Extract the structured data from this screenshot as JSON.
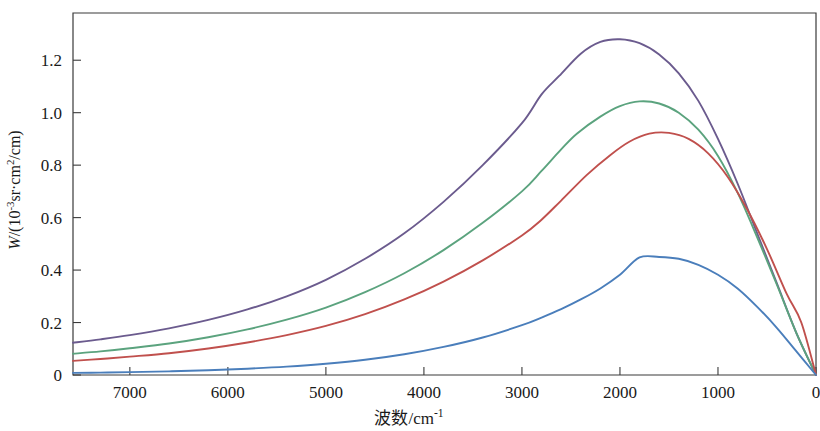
{
  "chart_data": {
    "type": "line",
    "title": "",
    "subtitle": "",
    "xlabel_parts": {
      "cjk": "波数",
      "unit": "/cm",
      "unit_exp": "-1"
    },
    "xlabel": "波数/cm-1",
    "ylabel_parts": {
      "symbol": "W",
      "open": "/(10",
      "exp": "-3",
      "mid": "sr·cm",
      "sq": "2",
      "close": "/cm)"
    },
    "ylabel": "W/(10-3sr·cm2/cm)",
    "xlim": [
      7580,
      0
    ],
    "ylim": [
      0,
      1.38
    ],
    "x_reversed": true,
    "grid": false,
    "legend": "none",
    "xticks": [
      7000,
      6000,
      5000,
      4000,
      3000,
      2000,
      1000,
      0
    ],
    "xtick_labels": [
      "7000",
      "6000",
      "5000",
      "4000",
      "3000",
      "2000",
      "1000",
      "0"
    ],
    "yticks": [
      0,
      0.2,
      0.4,
      0.6,
      0.8,
      1.0,
      1.2
    ],
    "ytick_labels": [
      "0",
      "0.2",
      "0.4",
      "0.6",
      "0.8",
      "1.0",
      "1.2"
    ],
    "axis_color": "#3a3a3a",
    "series": [
      {
        "name": "curve-purple",
        "color": "#6b5b8e",
        "peak_x": 2620,
        "peak_y": 1.28,
        "x": [
          7580,
          7300,
          7000,
          6600,
          6200,
          5800,
          5400,
          5000,
          4600,
          4200,
          3800,
          3400,
          3000,
          2800,
          2620,
          2400,
          2200,
          2000,
          1800,
          1600,
          1400,
          1200,
          1000,
          800,
          600,
          400,
          200,
          0
        ],
        "values": [
          0.123,
          0.136,
          0.152,
          0.178,
          0.21,
          0.25,
          0.3,
          0.363,
          0.443,
          0.54,
          0.66,
          0.8,
          0.96,
          1.07,
          1.14,
          1.225,
          1.27,
          1.28,
          1.265,
          1.222,
          1.15,
          1.045,
          0.9,
          0.73,
          0.54,
          0.35,
          0.16,
          0.0
        ]
      },
      {
        "name": "curve-green",
        "color": "#5ba37e",
        "peak_x": 2440,
        "peak_y": 1.045,
        "x": [
          7580,
          7300,
          7000,
          6600,
          6200,
          5800,
          5400,
          5000,
          4600,
          4200,
          3800,
          3400,
          3000,
          2800,
          2600,
          2440,
          2200,
          2000,
          1800,
          1600,
          1400,
          1200,
          1000,
          800,
          600,
          400,
          200,
          0
        ],
        "values": [
          0.081,
          0.09,
          0.102,
          0.12,
          0.144,
          0.174,
          0.211,
          0.257,
          0.316,
          0.388,
          0.476,
          0.58,
          0.7,
          0.778,
          0.86,
          0.92,
          0.985,
          1.025,
          1.043,
          1.035,
          1.0,
          0.935,
          0.835,
          0.695,
          0.525,
          0.345,
          0.16,
          0.0
        ]
      },
      {
        "name": "curve-red",
        "color": "#c0504d",
        "peak_x": 2340,
        "peak_y": 0.925,
        "x": [
          7580,
          7300,
          7000,
          6600,
          6200,
          5800,
          5400,
          5000,
          4600,
          4200,
          3800,
          3400,
          3000,
          2800,
          2600,
          2340,
          2100,
          1900,
          1700,
          1500,
          1300,
          1100,
          900,
          700,
          500,
          300,
          150,
          0
        ],
        "values": [
          0.054,
          0.061,
          0.07,
          0.083,
          0.101,
          0.124,
          0.152,
          0.187,
          0.232,
          0.288,
          0.356,
          0.437,
          0.532,
          0.592,
          0.665,
          0.762,
          0.838,
          0.89,
          0.92,
          0.923,
          0.9,
          0.845,
          0.755,
          0.63,
          0.48,
          0.31,
          0.2,
          0.0
        ]
      },
      {
        "name": "curve-blue",
        "color": "#4a7ebb",
        "peak_x": 1800,
        "peak_y": 0.45,
        "x": [
          7580,
          7300,
          7000,
          6600,
          6200,
          5800,
          5400,
          5000,
          4600,
          4200,
          3800,
          3400,
          3000,
          2800,
          2600,
          2400,
          2200,
          2000,
          1800,
          1600,
          1400,
          1200,
          1000,
          800,
          600,
          400,
          200,
          0
        ],
        "values": [
          0.008,
          0.009,
          0.011,
          0.014,
          0.018,
          0.024,
          0.032,
          0.043,
          0.058,
          0.079,
          0.107,
          0.143,
          0.19,
          0.219,
          0.251,
          0.288,
          0.33,
          0.382,
          0.448,
          0.45,
          0.443,
          0.42,
          0.382,
          0.33,
          0.26,
          0.18,
          0.09,
          0.0
        ]
      }
    ],
    "geometry": {
      "plot_left_px": 73,
      "plot_right_px": 816,
      "plot_top_px": 13,
      "plot_bottom_px": 375,
      "px_per_1000_wavenumber": 98,
      "px_per_unit_y": 260
    }
  }
}
